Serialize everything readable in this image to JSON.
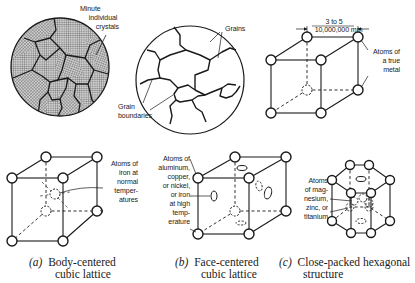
{
  "figure": {
    "top_row": {
      "crystals": {
        "label_lines": [
          "Minute",
          "individual",
          "crystals"
        ]
      },
      "grains": {
        "grains_label": "Grains",
        "boundaries_label_lines": [
          "Grain",
          "boundaries"
        ]
      },
      "unit_cell": {
        "dimension_numerator": "3 to 5",
        "dimension_denominator": "10,000,000 mm",
        "label_lines": [
          "Atoms of",
          "a true",
          "metal"
        ]
      }
    },
    "bottom_row": [
      {
        "label_lines": [
          "Atoms of",
          "iron at",
          "normal",
          "temper-",
          "atures"
        ],
        "caption_tag": "(a)",
        "caption_lines": [
          "Body-centered",
          "cubic lattice"
        ]
      },
      {
        "label_lines": [
          "Atoms of",
          "aluminum,",
          "copper,",
          "or nickel,",
          "or iron",
          "at high",
          "temp-",
          "erature"
        ],
        "caption_tag": "(b)",
        "caption_lines": [
          "Face-centered",
          "cubic lattice"
        ]
      },
      {
        "label_lines": [
          "Atoms",
          "of mag-",
          "nesium,",
          "zinc, or",
          "titanium"
        ],
        "caption_tag": "(c)",
        "caption_lines": [
          "Close-packed hexagonal",
          "structure"
        ]
      }
    ]
  },
  "colors": {
    "ink": "#1a1a1a",
    "background": "#ffffff",
    "hatch": "#555555"
  }
}
